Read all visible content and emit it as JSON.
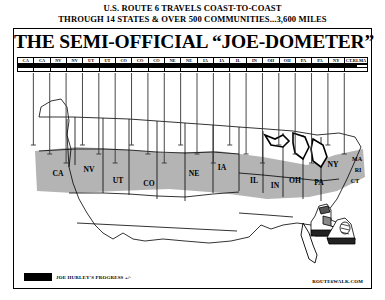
{
  "headline": {
    "line1": "U.S. ROUTE 6 TRAVELS COAST-TO-COAST",
    "line2": "THROUGH 14 STATES & OVER 500 COMMUNITIES...3,600 MILES"
  },
  "panel": {
    "title": "THE SEMI-OFFICIAL “JOE-DOMETER”"
  },
  "odometer": {
    "segments": [
      {
        "label": "CA"
      },
      {
        "label": "CA"
      },
      {
        "label": "NV"
      },
      {
        "label": "NV"
      },
      {
        "label": "UT"
      },
      {
        "label": "UT"
      },
      {
        "label": "CO"
      },
      {
        "label": "CO"
      },
      {
        "label": "CO"
      },
      {
        "label": "NE"
      },
      {
        "label": "NE"
      },
      {
        "label": "IA"
      },
      {
        "label": "IA"
      },
      {
        "label": "IL"
      },
      {
        "label": "IN"
      },
      {
        "label": "OH"
      },
      {
        "label": "OH"
      },
      {
        "label": "PA"
      },
      {
        "label": "PA"
      },
      {
        "label": "NY"
      },
      {
        "label": "CT-RI-MA",
        "wide": true
      }
    ],
    "progress_percent": 97
  },
  "map": {
    "corridor_states": [
      {
        "abbr": "CA",
        "x": 41,
        "y": 103
      },
      {
        "abbr": "NV",
        "x": 72,
        "y": 99
      },
      {
        "abbr": "UT",
        "x": 101,
        "y": 110
      },
      {
        "abbr": "CO",
        "x": 132,
        "y": 113
      },
      {
        "abbr": "NE",
        "x": 177,
        "y": 103
      },
      {
        "abbr": "IA",
        "x": 205,
        "y": 97
      },
      {
        "abbr": "IL",
        "x": 237,
        "y": 110
      },
      {
        "abbr": "IN",
        "x": 258,
        "y": 115
      },
      {
        "abbr": "OH",
        "x": 278,
        "y": 110
      },
      {
        "abbr": "PA",
        "x": 302,
        "y": 112
      },
      {
        "abbr": "NY",
        "x": 316,
        "y": 94
      },
      {
        "abbr": "MA",
        "x": 340,
        "y": 88
      },
      {
        "abbr": "RI",
        "x": 341,
        "y": 99
      },
      {
        "abbr": "CT",
        "x": 338,
        "y": 110
      }
    ]
  },
  "legend": {
    "label": "JOE HURLEY'S PROGRESS +/-"
  },
  "credit": {
    "text": "ROUTE6WALK.COM"
  },
  "colors": {
    "ink": "#000000",
    "paper": "#ffffff",
    "corridor_fill": "#b4b4b4",
    "lake_fill": "#ffffff"
  }
}
